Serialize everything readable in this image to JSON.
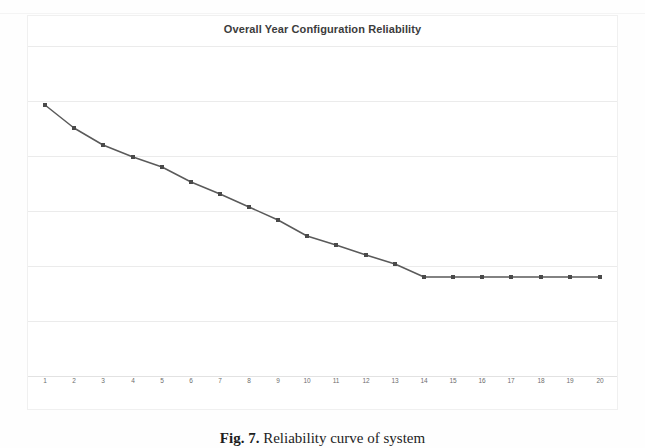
{
  "figure": {
    "caption_label": "Fig. 7.",
    "caption_text": "Reliability curve of system"
  },
  "chart_data": {
    "type": "line",
    "title": "Overall Year Configuration Reliability",
    "xlabel": "",
    "ylabel": "",
    "grid": true,
    "legend": "none",
    "marker": "square",
    "line_color": "#5a5a5a",
    "marker_color": "#4a4a4a",
    "gridline_color": "#ebebeb",
    "categories": [
      "1",
      "2",
      "3",
      "4",
      "5",
      "6",
      "7",
      "8",
      "9",
      "10",
      "11",
      "12",
      "13",
      "14",
      "15",
      "16",
      "17",
      "18",
      "19",
      "20"
    ],
    "x": [
      1,
      2,
      3,
      4,
      5,
      6,
      7,
      8,
      9,
      10,
      11,
      12,
      13,
      14,
      15,
      16,
      17,
      18,
      19,
      20
    ],
    "xlim": [
      1,
      20
    ],
    "ylim": [
      0,
      1
    ],
    "values": [
      0.93,
      0.86,
      0.8,
      0.76,
      0.7,
      0.65,
      0.6,
      0.55,
      0.49,
      0.43,
      0.38,
      0.33,
      0.29,
      0.25,
      0.25,
      0.25,
      0.25,
      0.25,
      0.25,
      0.25
    ],
    "pixel_points": [
      {
        "x": 45,
        "y": 105
      },
      {
        "x": 74,
        "y": 128
      },
      {
        "x": 103,
        "y": 145
      },
      {
        "x": 133,
        "y": 157
      },
      {
        "x": 162,
        "y": 167
      },
      {
        "x": 191,
        "y": 182
      },
      {
        "x": 220,
        "y": 194
      },
      {
        "x": 249,
        "y": 207
      },
      {
        "x": 278,
        "y": 220
      },
      {
        "x": 307,
        "y": 236
      },
      {
        "x": 336,
        "y": 245
      },
      {
        "x": 366,
        "y": 255
      },
      {
        "x": 395,
        "y": 264
      },
      {
        "x": 424,
        "y": 277
      },
      {
        "x": 453,
        "y": 277
      },
      {
        "x": 482,
        "y": 277
      },
      {
        "x": 511,
        "y": 277
      },
      {
        "x": 541,
        "y": 277
      },
      {
        "x": 570,
        "y": 277
      },
      {
        "x": 600,
        "y": 277
      }
    ],
    "gridline_pixel_y": [
      46,
      101,
      156,
      211,
      266,
      321,
      376
    ],
    "annotations": []
  }
}
